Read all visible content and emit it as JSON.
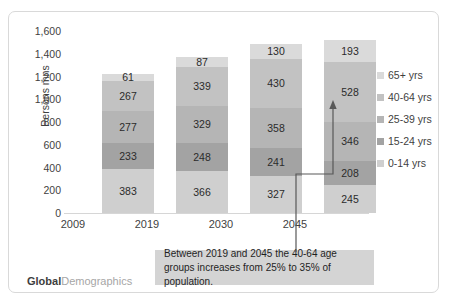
{
  "chart_data": {
    "type": "bar",
    "stacked": true,
    "title": "",
    "xlabel": "",
    "ylabel": "Persons mns",
    "ylim": [
      0,
      1600
    ],
    "ytick_step": 200,
    "yticks": [
      "0",
      "200",
      "400",
      "600",
      "800",
      "1,000",
      "1,200",
      "1,400",
      "1,600"
    ],
    "grid": false,
    "legend_position": "right",
    "categories": [
      "2009",
      "2019",
      "2030",
      "2045"
    ],
    "series": [
      {
        "name": "0-14 yrs",
        "values": [
          383,
          366,
          327,
          245
        ],
        "color": "#cfcfcf"
      },
      {
        "name": "15-24 yrs",
        "values": [
          233,
          248,
          241,
          208
        ],
        "color": "#a3a3a3"
      },
      {
        "name": "25-39 yrs",
        "values": [
          277,
          329,
          358,
          346
        ],
        "color": "#b5b5b5"
      },
      {
        "name": "40-64 yrs",
        "values": [
          267,
          339,
          430,
          528
        ],
        "color": "#c2c2c2"
      },
      {
        "name": "65+ yrs",
        "values": [
          61,
          87,
          130,
          193
        ],
        "color": "#dadada"
      }
    ],
    "totals": [
      1221,
      1369,
      1486,
      1520
    ],
    "annotation": "Between 2019 and 2045 the 40-64 age groups increases from 25% to 35% of population."
  },
  "legend": {
    "items": [
      {
        "label": "65+ yrs",
        "color": "#dadada"
      },
      {
        "label": "40-64 yrs",
        "color": "#c2c2c2"
      },
      {
        "label": "25-39 yrs",
        "color": "#b5b5b5"
      },
      {
        "label": "15-24 yrs",
        "color": "#a3a3a3"
      },
      {
        "label": "0-14 yrs",
        "color": "#cfcfcf"
      }
    ]
  },
  "callout": {
    "text": "Between 2019 and 2045 the 40-64 age groups increases from 25% to 35% of population."
  },
  "brand": {
    "bold": "Global",
    "light": "Demographics"
  }
}
